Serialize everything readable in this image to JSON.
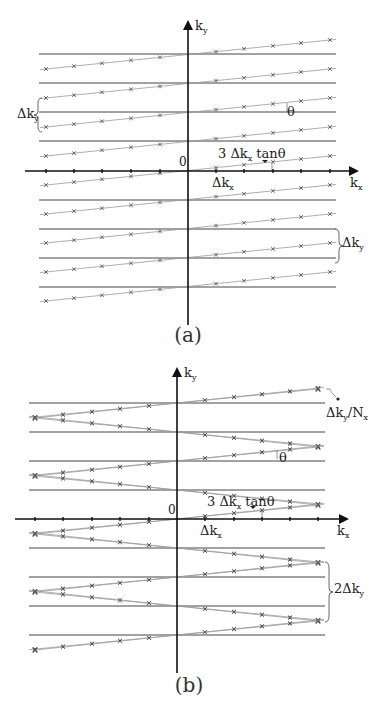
{
  "colors": {
    "axis": "#111111",
    "grid_line": "#444444",
    "traj_line": "#9a9a9a",
    "marker": "#555555",
    "text": "#222222"
  },
  "panels": [
    {
      "id": "a",
      "caption": "(a)",
      "caption_pos": [
        188,
        342
      ],
      "axis": {
        "origin": [
          188,
          171
        ],
        "x_from": 25,
        "x_to": 357,
        "y_from": 325,
        "y_to": 22,
        "x_label": "k",
        "x_sub": "x",
        "x_label_pos": [
          350,
          187
        ],
        "y_label": "k",
        "y_sub": "y",
        "y_label_pos": [
          195,
          30
        ],
        "origin_label": "0",
        "origin_label_pos": [
          179,
          166
        ]
      },
      "h_lines": {
        "x1": 39,
        "x2": 336,
        "ys": [
          54,
          83,
          112,
          141,
          200,
          229,
          258,
          287
        ]
      },
      "sample_xs": [
        46,
        74,
        102,
        131,
        160,
        216,
        244,
        273,
        301,
        330
      ],
      "axis_ticks_xs": [
        46,
        74,
        102,
        131,
        160,
        216,
        244,
        273,
        301,
        330
      ],
      "trajectories": [
        {
          "y_left": 69,
          "y_right": 40
        },
        {
          "y_left": 98,
          "y_right": 69
        },
        {
          "y_left": 127,
          "y_right": 98
        },
        {
          "y_left": 156,
          "y_right": 127
        },
        {
          "y_left": 185,
          "y_right": 156
        },
        {
          "y_left": 214,
          "y_right": 185
        },
        {
          "y_left": 243,
          "y_right": 214
        },
        {
          "y_left": 272,
          "y_right": 243
        },
        {
          "y_left": 301,
          "y_right": 272
        }
      ],
      "annotations": [
        {
          "id": "delta-ky-left",
          "text": "Δk",
          "sub": "y",
          "pos": [
            17,
            118
          ]
        },
        {
          "id": "theta",
          "text": "θ",
          "pos": [
            287,
            116
          ]
        },
        {
          "id": "three-dkx-tan",
          "text": "3 Δk",
          "sub": "x",
          "tail": " tanθ",
          "pos": [
            218,
            158
          ]
        },
        {
          "id": "delta-kx",
          "text": "Δk",
          "sub": "x",
          "pos": [
            212,
            187
          ]
        },
        {
          "id": "delta-ky-right",
          "text": "Δk",
          "sub": "y",
          "pos": [
            342,
            247
          ]
        }
      ]
    },
    {
      "id": "b",
      "caption": "(b)",
      "caption_pos": [
        189,
        692
      ],
      "axis": {
        "origin": [
          177,
          519
        ],
        "x_from": 15,
        "x_to": 347,
        "y_from": 673,
        "y_to": 369,
        "x_label": "k",
        "x_sub": "x",
        "x_label_pos": [
          337,
          535
        ],
        "y_label": "k",
        "y_sub": "y",
        "y_label_pos": [
          184,
          377
        ],
        "origin_label": "0",
        "origin_label_pos": [
          168,
          514
        ]
      },
      "h_lines": {
        "x1": 29,
        "x2": 325,
        "ys": [
          403,
          432,
          461,
          490,
          548,
          577,
          606,
          635
        ]
      },
      "sample_xs": [
        35,
        63,
        92,
        120,
        149,
        205,
        234,
        262,
        290,
        318
      ],
      "axis_ticks_xs": [
        35,
        63,
        92,
        120,
        149,
        205,
        234,
        262,
        290,
        318
      ],
      "zigzags": [
        {
          "vertex_side": "right",
          "vx": 318,
          "vy": 389,
          "start_y": 403,
          "dir": "up"
        },
        {
          "vertex_side": "left",
          "vx": 35,
          "vy": 418,
          "up_end_y": 403,
          "down_end_y": 432
        },
        {
          "vertex_side": "right",
          "vx": 318,
          "vy": 447,
          "up_end_y": 461,
          "down_end_y": 432
        },
        {
          "vertex_side": "left",
          "vx": 35,
          "vy": 476,
          "up_end_y": 461,
          "down_end_y": 490
        },
        {
          "vertex_side": "right",
          "vx": 318,
          "vy": 505,
          "up_end_y": 519,
          "down_end_y": 490
        },
        {
          "vertex_side": "left",
          "vx": 35,
          "vy": 534,
          "up_end_y": 519,
          "down_end_y": 548
        },
        {
          "vertex_side": "right",
          "vx": 318,
          "vy": 563,
          "up_end_y": 577,
          "down_end_y": 548
        },
        {
          "vertex_side": "left",
          "vx": 35,
          "vy": 592,
          "up_end_y": 577,
          "down_end_y": 606
        },
        {
          "vertex_side": "right",
          "vx": 318,
          "vy": 621,
          "up_end_y": 635,
          "down_end_y": 606
        },
        {
          "vertex_side": "left",
          "vx": 35,
          "vy": 650,
          "up_end_y": 635,
          "single": true
        }
      ],
      "annotations": [
        {
          "id": "delta-ky-over-nx",
          "text": "Δk",
          "sub": "y",
          "tail": "/N",
          "sub2": "x",
          "pos": [
            326,
            417
          ]
        },
        {
          "id": "theta",
          "text": "θ",
          "pos": [
            279,
            462
          ]
        },
        {
          "id": "three-dkx-tan",
          "text": "3 Δk",
          "sub": "x",
          "tail": " tanθ",
          "pos": [
            207,
            506
          ]
        },
        {
          "id": "delta-kx",
          "text": "Δk",
          "sub": "x",
          "pos": [
            200,
            535
          ]
        },
        {
          "id": "two-delta-ky",
          "text": "2Δk",
          "sub": "y",
          "pos": [
            334,
            593
          ]
        }
      ]
    }
  ]
}
